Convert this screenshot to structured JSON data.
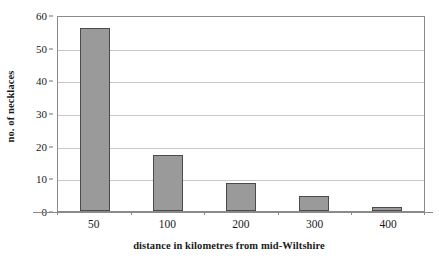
{
  "chart_data": {
    "type": "bar",
    "title": "",
    "subtitle": "",
    "xlabel": "distance in kilometres from mid-Wiltshire",
    "ylabel": "no. of necklaces",
    "categories": [
      "50",
      "100",
      "200",
      "300",
      "400"
    ],
    "values": [
      56,
      17,
      8.5,
      4.5,
      1.2
    ],
    "series": [
      {
        "name": "no. of necklaces",
        "values": [
          56,
          17,
          8.5,
          4.5,
          1.2
        ]
      }
    ],
    "ylim": [
      0,
      60
    ],
    "ytick_labels": [
      "0",
      "10",
      "20",
      "30",
      "40",
      "50",
      "60"
    ],
    "ytick_values": [
      0,
      10,
      20,
      30,
      40,
      50,
      60
    ],
    "xtick_labels": [
      "50",
      "100",
      "200",
      "300",
      "400"
    ],
    "grid": "horizontal",
    "legend": "none",
    "annotations": [],
    "colors": {
      "bar_fill": "#9a9a9a",
      "bar_border": "#4a4a4a",
      "gridline": "#c8c8c8",
      "axis": "#8a8a8a",
      "text": "#1a1a1a",
      "background": "#ffffff"
    }
  }
}
